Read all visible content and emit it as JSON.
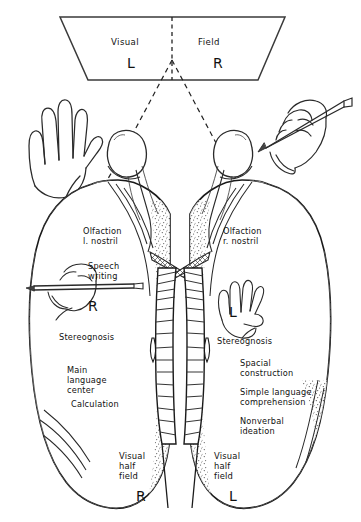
{
  "figure": {
    "background": "#ffffff",
    "ink": "#1a1a1a"
  },
  "visual_field": {
    "screen_label_left": "Visual",
    "screen_label_right": "Field",
    "half_left": "L",
    "half_right": "R"
  },
  "left_hemisphere": {
    "side_letter_hand": "R",
    "visual_half_field_letter": "R",
    "labels": [
      "Olfaction",
      "l. nostril",
      "Speech",
      "writing",
      "Stereognosis",
      "Main",
      "language",
      "center",
      "Calculation",
      "Visual",
      "half",
      "field"
    ],
    "olfaction_line1": "Olfaction",
    "olfaction_line2": "l. nostril",
    "speech_line1": "Speech",
    "speech_line2": "writing",
    "stereognosis": "Stereognosis",
    "main_lang_line1": "Main",
    "main_lang_line2": "language",
    "main_lang_line3": "center",
    "calculation": "Calculation",
    "vhf_line1": "Visual",
    "vhf_line2": "half",
    "vhf_line3": "field"
  },
  "right_hemisphere": {
    "side_letter_hand": "L",
    "visual_half_field_letter": "L",
    "olfaction_line1": "Olfaction",
    "olfaction_line2": "r. nostril",
    "stereognosis": "Stereognosis",
    "spacial_line1": "Spacial",
    "spacial_line2": "construction",
    "simple_lang_line1": "Simple language",
    "simple_lang_line2": "comprehension",
    "nonverbal_line1": "Nonverbal",
    "nonverbal_line2": "ideation",
    "vhf_line1": "Visual",
    "vhf_line2": "half",
    "vhf_line3": "field"
  },
  "icons": {
    "left_hand": "open-left-hand",
    "right_hand_pencil": "right-hand-holding-pencil",
    "inset_hand_pencil": "hand-holding-pencil-inset",
    "inset_hand_flat": "flat-hand-inset",
    "eye_left": "eyeball-left",
    "eye_right": "eyeball-right",
    "corpus_callosum": "severed-corpus-callosum",
    "optic_chiasm": "optic-chiasm"
  }
}
